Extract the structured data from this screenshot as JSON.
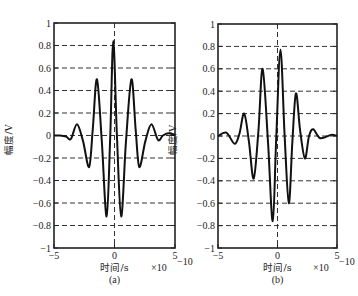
{
  "chart_data": [
    {
      "type": "line",
      "panel_label": "(a)",
      "title": "",
      "xlabel": "时间/s",
      "ylabel": "幅度/V",
      "x_exponent_label": "×10",
      "x_exponent_power": "-10",
      "xlim": [
        -5,
        5
      ],
      "ylim": [
        -1,
        1
      ],
      "xticks": [
        -5,
        0,
        5
      ],
      "xtick_labels": [
        "-5",
        "0",
        "5"
      ],
      "yticks": [
        1,
        0.8,
        0.6,
        0.4,
        0.2,
        0,
        -0.2,
        -0.4,
        -0.6,
        -0.8,
        -1
      ],
      "ytick_labels": [
        "1",
        "0.8",
        "0.6",
        "0.4",
        "0.2",
        "0",
        "-0.2",
        "-0.4",
        "-0.6",
        "-0.8",
        "-1"
      ],
      "grid": "dashed horizontal at y ticks, dashed vertical at x=0",
      "series": [
        {
          "name": "waveform-a",
          "x": [
            -5,
            -4.5,
            -4.0,
            -3.6,
            -3.1,
            -2.6,
            -2.1,
            -1.8,
            -1.45,
            -1.05,
            -0.65,
            -0.35,
            -0.1,
            0.2,
            0.55,
            0.95,
            1.4,
            1.75,
            2.05,
            2.55,
            3.05,
            3.6,
            4.0,
            4.5,
            5
          ],
          "y": [
            0,
            0,
            -0.01,
            -0.03,
            0.1,
            -0.05,
            -0.28,
            0.05,
            0.5,
            -0.05,
            -0.72,
            0.0,
            0.84,
            0.0,
            -0.72,
            -0.05,
            0.5,
            0.05,
            -0.28,
            -0.05,
            0.1,
            -0.04,
            0.0,
            0.02,
            0
          ]
        }
      ]
    },
    {
      "type": "line",
      "panel_label": "(b)",
      "title": "",
      "xlabel": "时间/s",
      "ylabel": "幅度/V",
      "x_exponent_label": "×10",
      "x_exponent_power": "-10",
      "xlim": [
        -5,
        5
      ],
      "ylim": [
        -1,
        1
      ],
      "xticks": [
        -5,
        0,
        5
      ],
      "xtick_labels": [
        "-5",
        "0",
        "5"
      ],
      "yticks": [
        1,
        0.8,
        0.6,
        0.4,
        0.2,
        0,
        -0.2,
        -0.4,
        -0.6,
        -0.8,
        -1
      ],
      "ytick_labels": [
        "1",
        "0.8",
        "0.6",
        "0.4",
        "0.2",
        "0",
        "-0.2",
        "-0.4",
        "-0.6",
        "-0.8",
        "-1"
      ],
      "grid": "dashed horizontal at y ticks, dashed vertical at x=0",
      "series": [
        {
          "name": "waveform-b",
          "x": [
            -5,
            -4.3,
            -3.6,
            -3.2,
            -2.8,
            -2.4,
            -2.0,
            -1.6,
            -1.25,
            -0.8,
            -0.4,
            -0.1,
            0.25,
            0.6,
            0.95,
            1.25,
            1.55,
            1.9,
            2.3,
            2.65,
            3.0,
            3.6,
            4.5,
            5
          ],
          "y": [
            0,
            0.03,
            -0.07,
            0.02,
            0.2,
            -0.05,
            -0.38,
            0.05,
            0.6,
            -0.05,
            -0.76,
            0.0,
            0.77,
            0.0,
            -0.6,
            -0.05,
            0.38,
            0.05,
            -0.2,
            0.0,
            0.06,
            -0.02,
            0.01,
            0
          ]
        }
      ]
    }
  ]
}
